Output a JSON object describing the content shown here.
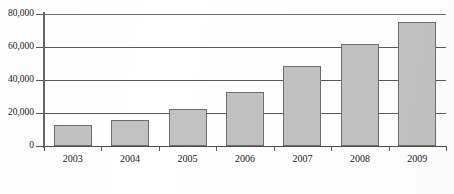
{
  "chart_data": {
    "type": "bar",
    "title": "",
    "subtitle": "",
    "xlabel": "",
    "ylabel": "",
    "categories": [
      "2003",
      "2004",
      "2005",
      "2006",
      "2007",
      "2008",
      "2009"
    ],
    "values": [
      12500,
      16000,
      22500,
      33000,
      48500,
      62000,
      75000
    ],
    "ylim": [
      0,
      80000
    ],
    "y_ticks": [
      0,
      20000,
      40000,
      60000,
      80000
    ],
    "y_tick_labels": [
      "0",
      "20,000",
      "40,000",
      "60,000",
      "80,000"
    ],
    "grid": true,
    "legend": false,
    "legend_position": "none",
    "series": [
      {
        "name": "",
        "values": [
          12500,
          16000,
          22500,
          33000,
          48500,
          62000,
          75000
        ]
      }
    ],
    "colors": {
      "bar_fill": "#c2c2c2",
      "bar_stroke": "#6e6e6e",
      "gridline": "#595959",
      "axis": "#4d4d4d",
      "text": "#1a1a1a",
      "background": "#ffffff"
    }
  }
}
